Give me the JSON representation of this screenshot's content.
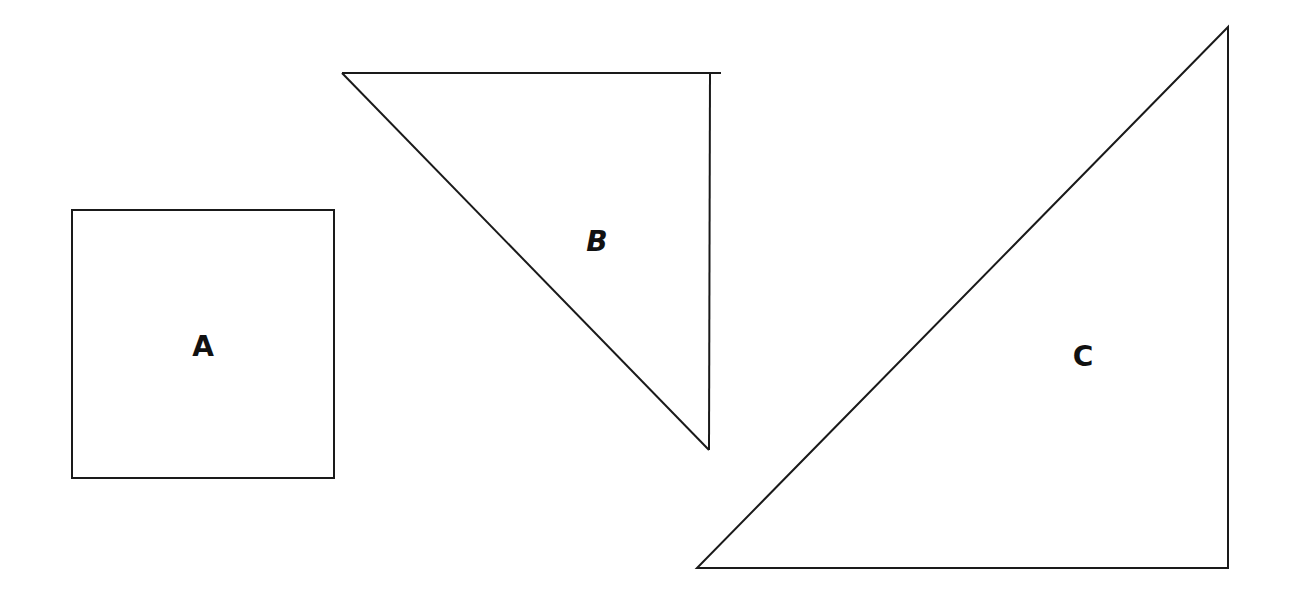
{
  "diagram": {
    "stroke_color": "#1a1a1a",
    "background": "#ffffff",
    "shapes": [
      {
        "id": "A",
        "type": "square",
        "label": "A",
        "points": [
          [
            72,
            210
          ],
          [
            334,
            210
          ],
          [
            334,
            478
          ],
          [
            72,
            478
          ]
        ],
        "label_pos": [
          203,
          355
        ]
      },
      {
        "id": "B",
        "type": "right-triangle",
        "label": "B",
        "points": [
          [
            342,
            73
          ],
          [
            710,
            73
          ],
          [
            709,
            450
          ]
        ],
        "top_edge_overhang_to": 721,
        "label_pos": [
          597,
          250
        ]
      },
      {
        "id": "C",
        "type": "right-triangle",
        "label": "C",
        "points": [
          [
            1228,
            27
          ],
          [
            1228,
            568
          ],
          [
            697,
            568
          ]
        ],
        "label_pos": [
          1083,
          356
        ]
      }
    ]
  }
}
